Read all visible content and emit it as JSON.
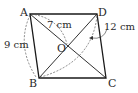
{
  "figure": {
    "type": "parallelogram",
    "vertices": [
      {
        "name": "A",
        "x": 30,
        "y": 14
      },
      {
        "name": "D",
        "x": 97,
        "y": 14
      },
      {
        "name": "C",
        "x": 106,
        "y": 78
      },
      {
        "name": "B",
        "x": 39,
        "y": 78
      }
    ],
    "center": {
      "name": "O",
      "x": 68,
      "y": 46
    },
    "labels": {
      "A": "A",
      "B": "B",
      "C": "C",
      "D": "D",
      "O": "O"
    },
    "measurements": {
      "AB": "9 cm",
      "AO": "7 cm",
      "BD": "12 cm"
    },
    "colors": {
      "stroke": "#1a1a1a",
      "dashed": "#555555",
      "text": "#2a2a2a"
    }
  }
}
